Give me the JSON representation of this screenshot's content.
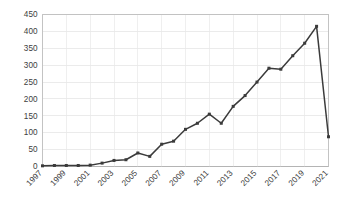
{
  "chart_data": {
    "type": "line",
    "title": "",
    "subtitle": "",
    "xlabel": "",
    "ylabel": "",
    "grid": true,
    "legend": false,
    "legend_position": "none",
    "line_color": "#3b3b3b",
    "marker": "square",
    "x": [
      1997,
      1998,
      1999,
      2000,
      2001,
      2002,
      2003,
      2004,
      2005,
      2006,
      2007,
      2008,
      2009,
      2010,
      2011,
      2012,
      2013,
      2014,
      2015,
      2016,
      2017,
      2018,
      2019,
      2020,
      2021
    ],
    "values": [
      2,
      3,
      3,
      3,
      4,
      10,
      18,
      20,
      40,
      30,
      66,
      75,
      110,
      128,
      155,
      128,
      178,
      210,
      250,
      291,
      288,
      328,
      365,
      415,
      88
    ],
    "categories": [
      "1997",
      "1998",
      "1999",
      "2000",
      "2001",
      "2002",
      "2003",
      "2004",
      "2005",
      "2006",
      "2007",
      "2008",
      "2009",
      "2010",
      "2011",
      "2012",
      "2013",
      "2014",
      "2015",
      "2016",
      "2017",
      "2018",
      "2019",
      "2020",
      "2021"
    ],
    "xlim": [
      1997,
      2021
    ],
    "ylim": [
      0,
      450
    ],
    "ytick_labels": [
      "0",
      "50",
      "100",
      "150",
      "200",
      "250",
      "300",
      "350",
      "400",
      "450"
    ],
    "ytick_values": [
      0,
      50,
      100,
      150,
      200,
      250,
      300,
      350,
      400,
      450
    ],
    "xtick_labels": [
      "1997",
      "1999",
      "2001",
      "2003",
      "2005",
      "2007",
      "2009",
      "2011",
      "2013",
      "2015",
      "2017",
      "2019",
      "2021"
    ],
    "xtick_values": [
      1997,
      1999,
      2001,
      2003,
      2005,
      2007,
      2009,
      2011,
      2013,
      2015,
      2017,
      2019,
      2021
    ],
    "annotations": []
  }
}
